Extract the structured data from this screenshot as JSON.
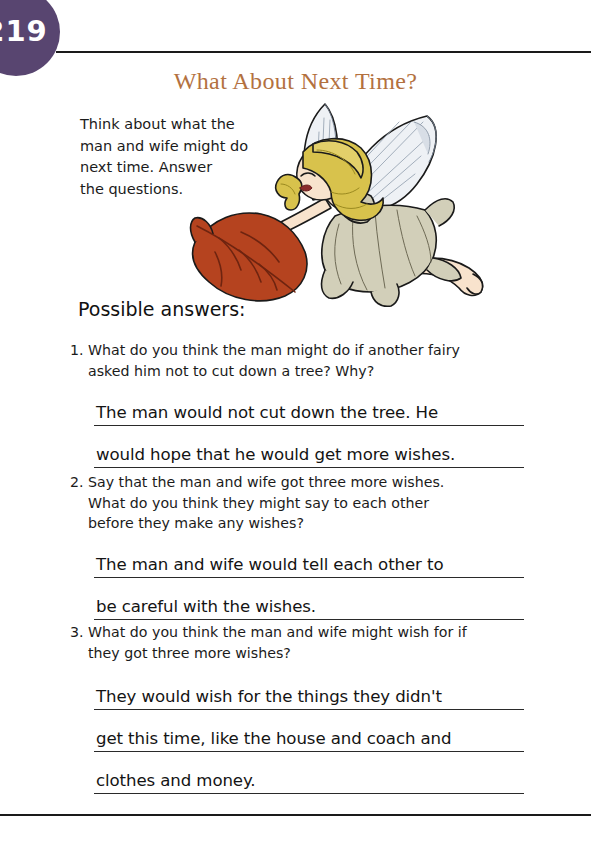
{
  "page": {
    "number": "219",
    "badge_color": "#584570",
    "title": "What About Next Time?",
    "title_color": "#b3713f"
  },
  "intro": {
    "lines": [
      "Think about what the",
      "man and wife might do",
      "next time. Answer",
      "the questions."
    ],
    "text": "Think about what the man and wife might do next time. Answer the questions."
  },
  "illustration": {
    "name": "fairy-with-leaf",
    "description": "Flying fairy with blonde hair, translucent wings, beige dress, holding a red-orange leaf",
    "colors": {
      "hair": "#d7c14a",
      "wing": "#e9edf2",
      "dress": "#cfcbb4",
      "leaf": "#b5431f",
      "skin": "#f6e0cb"
    }
  },
  "answers_heading": "Possible answers:",
  "questions": [
    {
      "number": "1.",
      "lines": [
        "What do you think the man might do if another fairy",
        "asked him not to cut down a tree? Why?"
      ],
      "answer_lines": [
        "The man would not cut down the tree. He",
        "would hope that he would get more wishes."
      ]
    },
    {
      "number": "2.",
      "lines": [
        "Say that the man and wife got three more wishes.",
        "What do you think they might say to each other",
        "before they make any wishes?"
      ],
      "answer_lines": [
        "The man and wife would tell each other to",
        "be careful with the wishes."
      ]
    },
    {
      "number": "3.",
      "lines": [
        "What do you think the man and wife might wish for if",
        "they got three more wishes?"
      ],
      "answer_lines": [
        "They would wish for the things they didn't",
        "get this time, like the house and coach and",
        "clothes and money."
      ]
    }
  ]
}
